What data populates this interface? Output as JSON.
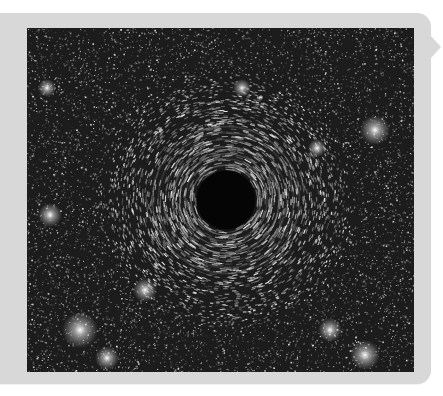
{
  "panel": {
    "background_color": "#d8d8d8",
    "pointer_direction": "right"
  },
  "image": {
    "subject": "black hole gravitational lensing of a dense starfield",
    "alt": "Simulated black hole with gravitational lensing rings in a dense star field",
    "width": 387,
    "height": 344,
    "palette": {
      "sky": "#1c1c1c",
      "star": "#ffffff",
      "shadow": "#050505"
    },
    "black_hole": {
      "center_x": 199,
      "center_y": 172,
      "shadow_radius": 29,
      "lensing_ring_radius": 68
    },
    "bright_stars": [
      {
        "x": 348,
        "y": 102,
        "r": 5
      },
      {
        "x": 23,
        "y": 187,
        "r": 4
      },
      {
        "x": 53,
        "y": 302,
        "r": 6
      },
      {
        "x": 118,
        "y": 262,
        "r": 4
      },
      {
        "x": 338,
        "y": 327,
        "r": 5
      },
      {
        "x": 80,
        "y": 330,
        "r": 4
      },
      {
        "x": 303,
        "y": 302,
        "r": 4
      },
      {
        "x": 290,
        "y": 120,
        "r": 3
      },
      {
        "x": 20,
        "y": 60,
        "r": 3
      },
      {
        "x": 215,
        "y": 60,
        "r": 3
      }
    ]
  }
}
